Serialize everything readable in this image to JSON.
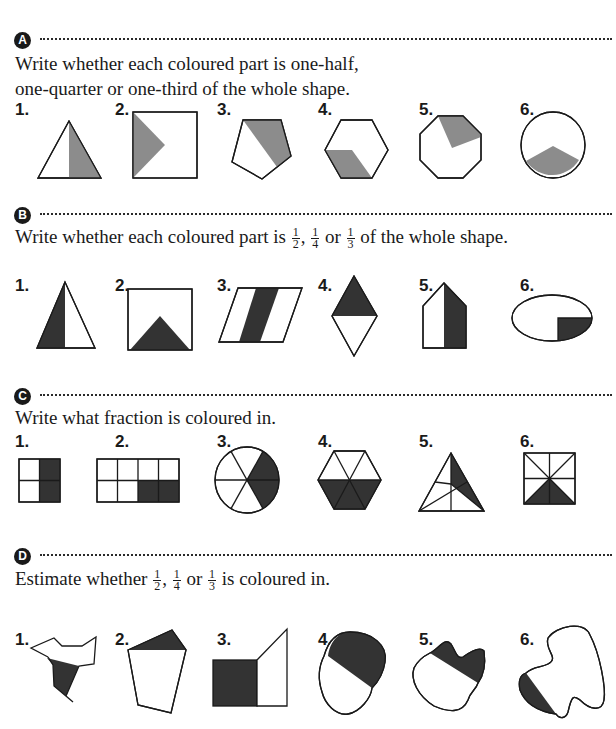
{
  "sections": [
    {
      "letter": "A",
      "instruction_line1": "Write whether each coloured part is one-half,",
      "instruction_line2": "one-quarter or one-third of the whole shape.",
      "items": [
        {
          "number": "1.",
          "shape": "triangle",
          "shaded": "right half"
        },
        {
          "number": "2.",
          "shape": "square",
          "shaded": "left triangle"
        },
        {
          "number": "3.",
          "shape": "pentagon",
          "shaded": "right portion"
        },
        {
          "number": "4.",
          "shape": "hexagon",
          "shaded": "bottom-left parallelogram"
        },
        {
          "number": "5.",
          "shape": "octagon",
          "shaded": "top-right sector"
        },
        {
          "number": "6.",
          "shape": "circle",
          "shaded": "bottom sector"
        }
      ]
    },
    {
      "letter": "B",
      "instruction_pre": "Write whether each coloured part is",
      "fractions": [
        {
          "num": "1",
          "den": "2"
        },
        {
          "num": "1",
          "den": "4"
        },
        {
          "num": "1",
          "den": "3"
        }
      ],
      "sep1": ",",
      "sep2": "or",
      "instruction_post": "of the whole shape.",
      "items": [
        {
          "number": "1.",
          "shape": "triangle",
          "shaded": "left part"
        },
        {
          "number": "2.",
          "shape": "rectangle",
          "shaded": "bottom triangle"
        },
        {
          "number": "3.",
          "shape": "parallelogram",
          "shaded": "middle stripe"
        },
        {
          "number": "4.",
          "shape": "rhombus",
          "shaded": "top half"
        },
        {
          "number": "5.",
          "shape": "pentagon",
          "shaded": "right half"
        },
        {
          "number": "6.",
          "shape": "ellipse",
          "shaded": "bottom-right quarter"
        }
      ]
    },
    {
      "letter": "C",
      "instruction": "Write what fraction is coloured in.",
      "items": [
        {
          "number": "1.",
          "shape": "2x2 grid",
          "shaded": "2 of 4"
        },
        {
          "number": "2.",
          "shape": "4x2 grid",
          "shaded": "2 of 8"
        },
        {
          "number": "3.",
          "shape": "circle 6 sectors",
          "shaded": "2 of 6"
        },
        {
          "number": "4.",
          "shape": "hexagon 6 triangles",
          "shaded": "3 of 6"
        },
        {
          "number": "5.",
          "shape": "triangle 6 parts",
          "shaded": "2 of 6"
        },
        {
          "number": "6.",
          "shape": "square 8 triangles",
          "shaded": "2 of 8"
        }
      ]
    },
    {
      "letter": "D",
      "instruction_pre": "Estimate whether",
      "fractions": [
        {
          "num": "1",
          "den": "2"
        },
        {
          "num": "1",
          "den": "4"
        },
        {
          "num": "1",
          "den": "3"
        }
      ],
      "sep1": ",",
      "sep2": "or",
      "instruction_post": "is coloured in.",
      "items": [
        {
          "number": "1.",
          "shape": "irregular polygon"
        },
        {
          "number": "2.",
          "shape": "irregular pentagon"
        },
        {
          "number": "3.",
          "shape": "square with triangle"
        },
        {
          "number": "4.",
          "shape": "blob"
        },
        {
          "number": "5.",
          "shape": "blob with lobes"
        },
        {
          "number": "6.",
          "shape": "large blob"
        }
      ]
    }
  ],
  "colors": {
    "grey_fill": "#8c8c8c",
    "dark_fill": "#333333",
    "outline": "#1a1a1a"
  }
}
